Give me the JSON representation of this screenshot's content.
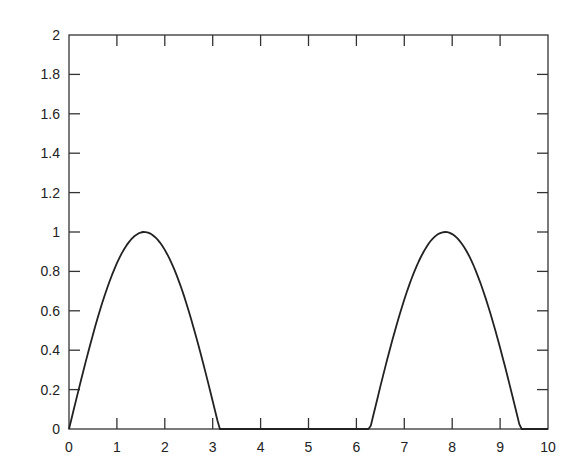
{
  "chart_data": {
    "type": "line",
    "title": "",
    "xlabel": "",
    "ylabel": "",
    "xlim": [
      0,
      10
    ],
    "ylim": [
      0,
      2
    ],
    "grid": false,
    "legend": null,
    "x_ticks": [
      "0",
      "1",
      "2",
      "3",
      "4",
      "5",
      "6",
      "7",
      "8",
      "9",
      "10"
    ],
    "y_ticks": [
      "0",
      "0.2",
      "0.4",
      "0.6",
      "0.8",
      "1",
      "1.2",
      "1.4",
      "1.6",
      "1.8",
      "2"
    ],
    "series": [
      {
        "name": "max(sin(x), 0)",
        "color": "#222222",
        "x": [
          0,
          0.4,
          0.8,
          1.2,
          1.6,
          2.0,
          2.4,
          2.8,
          3.14,
          3.6,
          4.0,
          4.4,
          4.8,
          5.2,
          5.6,
          6.0,
          6.28,
          6.68,
          7.08,
          7.48,
          7.88,
          8.28,
          8.68,
          9.08,
          9.42,
          9.8,
          10.0
        ],
        "values": [
          0,
          0.389,
          0.717,
          0.932,
          1.0,
          0.909,
          0.675,
          0.335,
          0,
          0,
          0,
          0,
          0,
          0,
          0,
          0,
          0,
          0.389,
          0.717,
          0.932,
          1.0,
          0.909,
          0.675,
          0.335,
          0,
          0,
          0
        ]
      }
    ]
  }
}
